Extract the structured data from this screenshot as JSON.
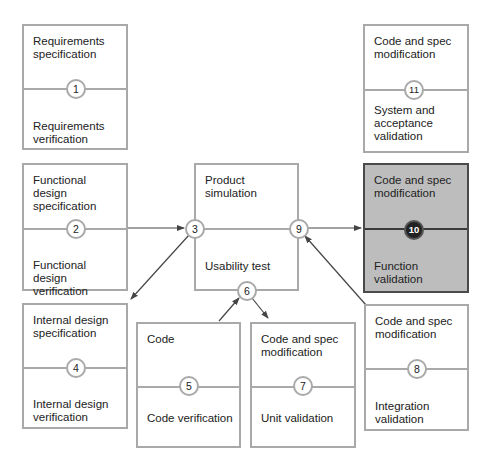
{
  "diagram": {
    "title": "",
    "boxes": [
      {
        "id": "b1",
        "top": "Requirements specification",
        "bottom": "Requirements verification",
        "node": "1"
      },
      {
        "id": "b11",
        "top": "Code and spec modification",
        "bottom": "System and acceptance validation",
        "node": "11"
      },
      {
        "id": "b2",
        "top": "Functional design specification",
        "bottom": "Functional design verification",
        "node": "2"
      },
      {
        "id": "b3",
        "top": "Product simulation",
        "bottom": "Usability test",
        "node_left": "3",
        "node_right": "9",
        "node_bottom": "6"
      },
      {
        "id": "b10",
        "top": "Code and spec modification",
        "bottom": "Function validation",
        "node": "10",
        "highlighted": true
      },
      {
        "id": "b4",
        "top": "Internal design specification",
        "bottom": "Internal design verification",
        "node": "4"
      },
      {
        "id": "b5",
        "top": "Code",
        "bottom": "Code verification",
        "node": "5"
      },
      {
        "id": "b7",
        "top": "Code and spec modification",
        "bottom": "Unit validation",
        "node": "7"
      },
      {
        "id": "b8",
        "top": "Code and spec modification",
        "bottom": "Integration validation",
        "node": "8"
      }
    ],
    "edges": [
      {
        "from": "2",
        "to": "3"
      },
      {
        "from": "3",
        "to": "4"
      },
      {
        "from": "5",
        "to": "6"
      },
      {
        "from": "6",
        "to": "7"
      },
      {
        "from": "8",
        "to": "9"
      },
      {
        "from": "9",
        "to": "10"
      }
    ],
    "colors": {
      "border": "#a9a9a9",
      "highlight_fill": "#bdbdbd",
      "highlight_border": "#4a4a4a",
      "arrow": "#444444"
    }
  }
}
